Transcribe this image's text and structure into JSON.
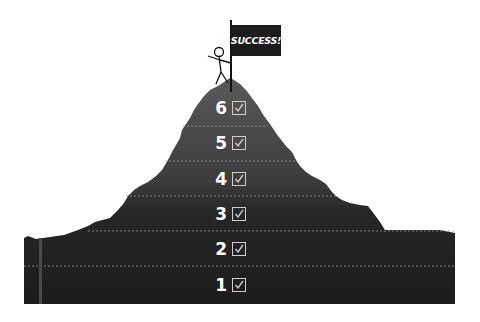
{
  "flag": {
    "label": "SUCCESS!"
  },
  "steps": [
    {
      "number": "6",
      "checked": true
    },
    {
      "number": "5",
      "checked": true
    },
    {
      "number": "4",
      "checked": true
    },
    {
      "number": "3",
      "checked": true
    },
    {
      "number": "2",
      "checked": true
    },
    {
      "number": "1",
      "checked": true
    }
  ],
  "colors": {
    "mountain_dark": "#1e1e1e",
    "mountain_mid": "#4a4a4a",
    "flag": "#1c1c1c",
    "checkbox": "#cfcfcf"
  }
}
